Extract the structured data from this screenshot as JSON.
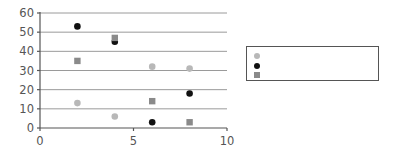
{
  "chart_data": {
    "type": "scatter",
    "title": "",
    "xlabel": "",
    "ylabel": "",
    "xlim": [
      0,
      10
    ],
    "ylim": [
      0,
      60
    ],
    "xticks": [
      0,
      5,
      10
    ],
    "yticks": [
      0,
      10,
      20,
      30,
      40,
      50,
      60
    ],
    "grid": "horizontal",
    "legend_position": "right",
    "series": [
      {
        "name": "",
        "marker": "circle",
        "color": "#b8b8b8",
        "x": [
          2,
          4,
          6,
          8
        ],
        "y": [
          13,
          6,
          32,
          31
        ]
      },
      {
        "name": "",
        "marker": "circle",
        "color": "#111111",
        "x": [
          2,
          4,
          6,
          8
        ],
        "y": [
          53,
          45,
          3,
          18
        ]
      },
      {
        "name": "",
        "marker": "square",
        "color": "#8a8a8a",
        "x": [
          2,
          4,
          6,
          8
        ],
        "y": [
          35,
          47,
          14,
          3
        ]
      }
    ]
  }
}
